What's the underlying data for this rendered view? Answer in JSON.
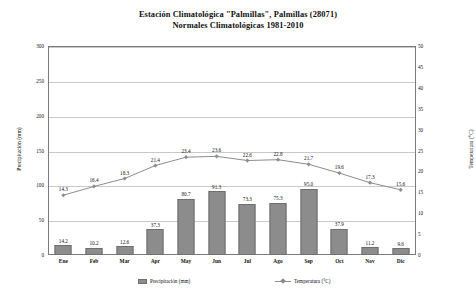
{
  "title": {
    "line1": "Estación Climatológica \"Palmillas\", Palmillas (28071)",
    "line2": "Normales Climatológicas 1981-2010"
  },
  "legend": {
    "precipitation_label": "Precipitación (mm)",
    "temperature_label": "Temperatura (°C)"
  },
  "axes": {
    "left_title": "Precipitación (mm)",
    "right_title": "Temperatura (°C)",
    "left_ticks": [
      "0",
      "50",
      "100",
      "150",
      "200",
      "250",
      "300"
    ],
    "right_ticks": [
      "0",
      "5",
      "10",
      "15",
      "20",
      "25",
      "30",
      "35",
      "40",
      "45",
      "50"
    ]
  },
  "colors": {
    "bar_fill": "#8c8c8c",
    "bar_border": "#6f6f6f",
    "line": "#8c8c8c",
    "grid": "#c9c9c9",
    "frame": "#7a7a7a",
    "text": "#111111"
  },
  "chart_data": {
    "type": "bar",
    "xlabel": "",
    "ylabel": "Precipitación (mm)",
    "y2label": "Temperatura (°C)",
    "ylim": [
      0,
      300
    ],
    "y2lim": [
      0,
      50
    ],
    "grid": true,
    "legend_position": "bottom",
    "categories": [
      "Ene",
      "Feb",
      "Mar",
      "Apr",
      "May",
      "Jun",
      "Jul",
      "Ago",
      "Sep",
      "Oct",
      "Nov",
      "Dic"
    ],
    "series": [
      {
        "name": "Precipitación (mm)",
        "type": "bar",
        "axis": "left",
        "values": [
          14.2,
          10.2,
          12.6,
          37.3,
          80.7,
          91.3,
          73.3,
          75.3,
          95.0,
          37.9,
          11.2,
          9.6
        ],
        "labels": [
          "14.2",
          "10.2",
          "12.6",
          "37.3",
          "80.7",
          "91.3",
          "73.3",
          "75.3",
          "95.0",
          "37.9",
          "11.2",
          "9.6"
        ]
      },
      {
        "name": "Temperatura (°C)",
        "type": "line",
        "axis": "right",
        "values": [
          14.3,
          16.4,
          18.3,
          21.4,
          23.4,
          23.6,
          22.6,
          22.8,
          21.7,
          19.6,
          17.3,
          15.6
        ],
        "labels": [
          "14.3",
          "16.4",
          "18.3",
          "21.4",
          "23.4",
          "23.6",
          "22.6",
          "22.8",
          "21.7",
          "19.6",
          "17.3",
          "15.6"
        ]
      }
    ]
  }
}
